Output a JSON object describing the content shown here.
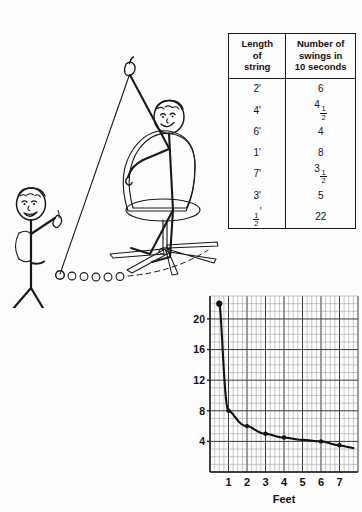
{
  "figure": {
    "ink_color": "#1a1a1a",
    "background_color": "#fdfdfd"
  },
  "table": {
    "headers": {
      "length_line1": "Length",
      "length_line2": "of",
      "length_line3": "string",
      "swings_line1": "Number of",
      "swings_line2": "swings in",
      "swings_line3": "10 seconds"
    },
    "rows": [
      {
        "length": "2'",
        "swings_whole": "6",
        "swings_num": "",
        "swings_den": ""
      },
      {
        "length": "4'",
        "swings_whole": "4",
        "swings_num": "1",
        "swings_den": "2"
      },
      {
        "length": "6'",
        "swings_whole": "4",
        "swings_num": "",
        "swings_den": ""
      },
      {
        "length": "1'",
        "swings_whole": "8",
        "swings_num": "",
        "swings_den": ""
      },
      {
        "length": "7'",
        "swings_whole": "3",
        "swings_num": "1",
        "swings_den": "2"
      },
      {
        "length": "3'",
        "swings_whole": "5",
        "swings_num": "",
        "swings_den": ""
      },
      {
        "length": "",
        "length_num": "1",
        "length_den": "2",
        "length_prime": "'",
        "swings_whole": "22",
        "swings_num": "",
        "swings_den": ""
      }
    ]
  },
  "chart_data": {
    "type": "line",
    "title": "",
    "xlabel": "Feet",
    "ylabel": "",
    "xlim": [
      0,
      8
    ],
    "ylim": [
      0,
      23
    ],
    "grid": true,
    "major_grid_step_x": 1,
    "major_grid_step_y": 4,
    "minor_grid_step_x": 0.25,
    "minor_grid_step_y": 1,
    "xticks": [
      "1",
      "2",
      "3",
      "4",
      "5",
      "6",
      "7"
    ],
    "xtick_values": [
      1,
      2,
      3,
      4,
      5,
      6,
      7
    ],
    "yticks": [
      "4",
      "8",
      "12",
      "16",
      "20"
    ],
    "ytick_values": [
      4,
      8,
      12,
      16,
      20
    ],
    "x": [
      0.5,
      1,
      2,
      3,
      4,
      5,
      6,
      7
    ],
    "y": [
      22,
      8,
      6,
      5,
      4.5,
      4.2,
      4,
      3.5
    ],
    "series": [
      {
        "name": "Number of swings in 10 seconds",
        "x": [
          0.5,
          1,
          2,
          3,
          4,
          5,
          6,
          7
        ],
        "values": [
          22,
          8,
          6,
          5,
          4.5,
          4.2,
          4,
          3.5
        ]
      }
    ],
    "markers": [
      {
        "x": 0.5,
        "y": 22
      },
      {
        "x": 1,
        "y": 8
      },
      {
        "x": 2,
        "y": 6
      },
      {
        "x": 3,
        "y": 5
      },
      {
        "x": 4,
        "y": 4.5
      },
      {
        "x": 6,
        "y": 4
      },
      {
        "x": 7,
        "y": 3.5
      }
    ],
    "curve_note": "inverse / hyperbolic decay"
  },
  "illustration": {
    "standing_figure_label": "standing-stick-figure-pointing",
    "seated_figure_label": "seated-stick-figure-holding-string",
    "chair_label": "office-swivel-chair",
    "pendulum_label": "pendulum-string-with-bob",
    "bob_trail_count": 6,
    "swing_arc_label": "dashed-swing-arc"
  }
}
